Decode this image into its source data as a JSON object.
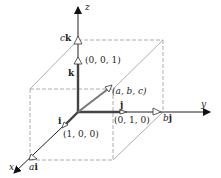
{
  "diagram": {
    "type": "3d-coordinate-vector-diagram",
    "axes": {
      "x": {
        "label": "x"
      },
      "y": {
        "label": "y"
      },
      "z": {
        "label": "z"
      }
    },
    "unit_vectors": {
      "i": {
        "label": "i",
        "coords": "(1, 0, 0)"
      },
      "j": {
        "label": "j",
        "coords": "(0, 1, 0)"
      },
      "k": {
        "label": "k",
        "coords": "(0, 0, 1)"
      }
    },
    "scaled_vectors": {
      "ai": {
        "coef": "a",
        "vec": "i"
      },
      "bj": {
        "coef": "b",
        "vec": "j"
      },
      "ck": {
        "coef": "c",
        "vec": "k"
      }
    },
    "point": {
      "coords": "(a, b, c)"
    },
    "colors": {
      "axis": "#222222",
      "unit_vector": "#555555",
      "box": "#9a9a9a",
      "text": "#222222"
    }
  }
}
